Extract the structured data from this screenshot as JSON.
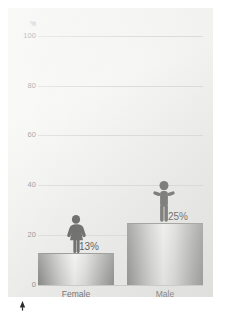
{
  "chart_data": {
    "type": "bar",
    "title": "",
    "subtitle": "",
    "xlabel": "",
    "ylabel": "%",
    "unit_label": "%",
    "categories": [
      "Female",
      "Male"
    ],
    "values": [
      13,
      25
    ],
    "value_labels": [
      "13%",
      "25%"
    ],
    "series": [
      {
        "name": "",
        "values": [
          13,
          25
        ]
      }
    ],
    "ylim": [
      0,
      100
    ],
    "yticks": [
      0,
      20,
      40,
      60,
      80,
      100
    ],
    "ytick_labels": [
      "0",
      "20",
      "40",
      "60",
      "80",
      "100"
    ],
    "grid": true,
    "legend": "none",
    "annotations": [
      {
        "name": "female-pictogram",
        "icon": "female-figure-icon",
        "category": "Female"
      },
      {
        "name": "male-pictogram",
        "icon": "male-figure-icon",
        "category": "Male"
      },
      {
        "name": "bottom-marker",
        "icon": "up-triangle-icon"
      }
    ],
    "colors": {
      "panel_background": "#f1f1ef",
      "gridline": "#dcdcda",
      "axis": "#c9c9c7",
      "bar_light": "#f4f4f2",
      "bar_dark": "#8a8a88",
      "tick_text": "#8e8e8c",
      "value_text": "#5a5a58",
      "category_text": "#6d6d6b",
      "pictogram": "#6e6e6c",
      "marker": "#2d2d2b"
    }
  }
}
